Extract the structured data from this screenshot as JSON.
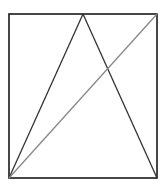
{
  "diagram": {
    "type": "geometry",
    "canvas": {
      "width": 167,
      "height": 191,
      "background": "#ffffff"
    },
    "rectangle": {
      "x": 9,
      "y": 14,
      "width": 148,
      "height": 164,
      "stroke": "#1a1a1a",
      "stroke_width": 1.6
    },
    "points": {
      "bottom_left": [
        9,
        178
      ],
      "bottom_right": [
        157,
        178
      ],
      "top_right": [
        157,
        14
      ],
      "top_apex": [
        83,
        14
      ]
    },
    "segments": [
      {
        "name": "left-side-of-triangle",
        "from": [
          9,
          178
        ],
        "to": [
          83,
          14
        ],
        "stroke": "#333333",
        "stroke_width": 1.3
      },
      {
        "name": "right-side-of-triangle",
        "from": [
          83,
          14
        ],
        "to": [
          157,
          178
        ],
        "stroke": "#333333",
        "stroke_width": 1.3
      },
      {
        "name": "diagonal",
        "from": [
          9,
          178
        ],
        "to": [
          157,
          14
        ],
        "stroke": "#888888",
        "stroke_width": 1.3
      }
    ]
  }
}
